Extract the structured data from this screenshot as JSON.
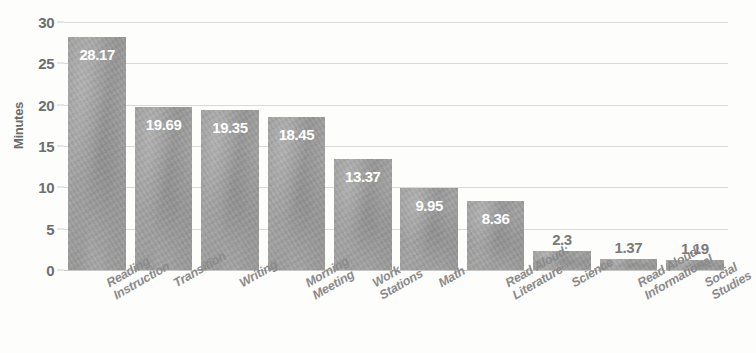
{
  "chart_data": {
    "type": "bar",
    "title": "",
    "xlabel": "",
    "ylabel": "Minutes",
    "ylim": [
      0,
      30
    ],
    "yticks": [
      0,
      5,
      10,
      15,
      20,
      25,
      30
    ],
    "grid": true,
    "legend": false,
    "orientation": "vertical",
    "categories": [
      "Reading\nInstruction",
      "Transition",
      "Writing",
      "Morning\nMeeting",
      "Work\nStations",
      "Math",
      "Read Aloud:\nLiterature",
      "Science",
      "Read Aloud:\nInformational",
      "Social\nStudies"
    ],
    "values": [
      28.17,
      19.69,
      19.35,
      18.45,
      13.37,
      9.95,
      8.36,
      2.3,
      1.37,
      1.19
    ],
    "value_labels": [
      "28.17",
      "19.69",
      "19.35",
      "18.45",
      "13.37",
      "9.95",
      "8.36",
      "2.3",
      "1.37",
      "1.19"
    ],
    "label_placement": [
      "inside",
      "inside",
      "inside",
      "inside",
      "inside",
      "inside",
      "inside",
      "outside",
      "outside",
      "outside"
    ],
    "colors": {
      "bar": "#9b9b9b",
      "background": "#fdfdfc",
      "gridline": "#d8d8d6",
      "label_inside": "#ffffff",
      "label_outside": "#7a7a7a",
      "tick_text": "#6e6e6e",
      "axis_title": "#6b6b6b",
      "category_text": "#8a8a8a"
    }
  }
}
